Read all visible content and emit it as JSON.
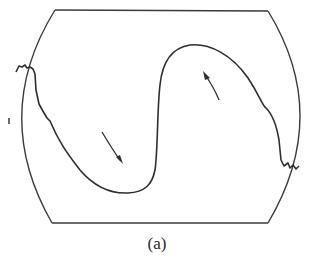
{
  "figure": {
    "caption": "(a)",
    "stroke_color": "#3a3a3a",
    "elements": [
      "frame-boundary",
      "s-shaped-curve",
      "arrow-down",
      "arrow-up"
    ]
  }
}
